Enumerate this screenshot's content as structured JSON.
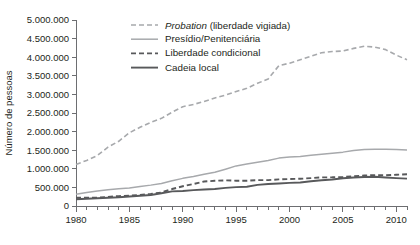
{
  "chart_data": {
    "type": "line",
    "title": "",
    "subtitle": "",
    "xlabel": "",
    "ylabel": "Número de pessoas",
    "xlim": [
      1980,
      2011
    ],
    "ylim": [
      0,
      5000000
    ],
    "grid": false,
    "legend_position": "top-left",
    "x_ticks_major": [
      "1980",
      "1985",
      "1990",
      "1995",
      "2000",
      "2005",
      "2010"
    ],
    "x_tick_values": [
      1980,
      1985,
      1990,
      1995,
      2000,
      2005,
      2010
    ],
    "x_minor_step": 1,
    "y_ticks": [
      "0",
      "500.000",
      "1.000.000",
      "1.500.000",
      "2.000.000",
      "2.500.000",
      "3.000.000",
      "3.500.000",
      "4.000.000",
      "4.500.000",
      "5.000.000"
    ],
    "y_tick_values": [
      0,
      500000,
      1000000,
      1500000,
      2000000,
      2500000,
      3000000,
      3500000,
      4000000,
      4500000,
      5000000
    ],
    "x": [
      1980,
      1981,
      1982,
      1983,
      1984,
      1985,
      1986,
      1987,
      1988,
      1989,
      1990,
      1991,
      1992,
      1993,
      1994,
      1995,
      1996,
      1997,
      1998,
      1999,
      2000,
      2001,
      2002,
      2003,
      2004,
      2005,
      2006,
      2007,
      2008,
      2009,
      2010,
      2011
    ],
    "series": [
      {
        "name": "Probation (liberdade vigiada)",
        "name_italic_prefix": "Probation",
        "name_rest": " (liberdade vigiada)",
        "color": "#a7a9ac",
        "style": "dashed",
        "width": 1.6,
        "dasharray": "5,3",
        "values": [
          1118000,
          1225000,
          1357000,
          1582000,
          1740000,
          1969000,
          2115000,
          2247000,
          2356000,
          2522000,
          2670000,
          2729000,
          2812000,
          2903000,
          2981000,
          3078000,
          3164000,
          3297000,
          3417000,
          3773000,
          3839000,
          3932000,
          4025000,
          4120000,
          4152000,
          4166000,
          4237000,
          4293000,
          4271000,
          4203000,
          4056000,
          3930000
        ]
      },
      {
        "name": "Presídio/Penitenciária",
        "color": "#a7a9ac",
        "style": "solid",
        "width": 1.5,
        "dasharray": "",
        "values": [
          316000,
          360000,
          402000,
          437000,
          463000,
          481000,
          523000,
          561000,
          607000,
          680000,
          743000,
          792000,
          851000,
          909000,
          990000,
          1078000,
          1128000,
          1176000,
          1224000,
          1287000,
          1316000,
          1330000,
          1367000,
          1391000,
          1421000,
          1448000,
          1492000,
          1517000,
          1524000,
          1525000,
          1518000,
          1505000
        ]
      },
      {
        "name": "Liberdade condicional",
        "color": "#58595b",
        "style": "dashed",
        "width": 1.9,
        "dasharray": "5,3",
        "values": [
          220000,
          226000,
          224000,
          246000,
          266000,
          277000,
          300000,
          326000,
          363000,
          456000,
          531000,
          590000,
          658000,
          677000,
          690000,
          679000,
          680000,
          694000,
          696000,
          715000,
          725000,
          732000,
          750000,
          769000,
          771000,
          780000,
          799000,
          821000,
          828000,
          824000,
          841000,
          854000
        ]
      },
      {
        "name": "Cadeia local",
        "color": "#58595b",
        "style": "solid",
        "width": 1.9,
        "dasharray": "",
        "values": [
          182000,
          196000,
          209000,
          223000,
          234000,
          256000,
          274000,
          295000,
          341000,
          393000,
          405000,
          426000,
          444000,
          459000,
          486000,
          507000,
          518000,
          567000,
          592000,
          605000,
          621000,
          631000,
          665000,
          691000,
          714000,
          747000,
          766000,
          780000,
          785000,
          767000,
          749000,
          736000
        ]
      }
    ]
  },
  "legend": {
    "items": [
      {
        "label": "Probation (liberdade vigiada)"
      },
      {
        "label": "Presídio/Penitenciária"
      },
      {
        "label": "Liberdade condicional"
      },
      {
        "label": "Cadeia local"
      }
    ]
  }
}
